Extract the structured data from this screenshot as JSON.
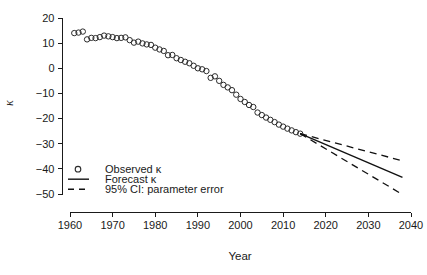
{
  "chart_data": {
    "type": "scatter",
    "title": "",
    "xlabel": "Year",
    "ylabel": "κ",
    "xlim": [
      1956,
      2042
    ],
    "ylim": [
      -54,
      22
    ],
    "xticks": [
      1960,
      1970,
      1980,
      1990,
      2000,
      2010,
      2020,
      2030,
      2040
    ],
    "xtick_labels": [
      "1960",
      "1970",
      "1980",
      "1990",
      "2000",
      "2010",
      "2020",
      "2030",
      "2040"
    ],
    "yticks": [
      20,
      10,
      0,
      -10,
      -20,
      -30,
      -40,
      -50
    ],
    "ytick_labels": [
      "20",
      "10",
      "0",
      "−10",
      "−20",
      "−30",
      "−40",
      "−50"
    ],
    "grid": false,
    "legend_position": "bottom-left",
    "series": [
      {
        "name": "Observed κ",
        "type": "scatter",
        "marker": "open-circle",
        "x": [
          1961,
          1962,
          1963,
          1964,
          1965,
          1966,
          1967,
          1968,
          1969,
          1970,
          1971,
          1972,
          1973,
          1974,
          1975,
          1976,
          1977,
          1978,
          1979,
          1980,
          1981,
          1982,
          1983,
          1984,
          1985,
          1986,
          1987,
          1988,
          1989,
          1990,
          1991,
          1992,
          1993,
          1994,
          1995,
          1996,
          1997,
          1998,
          1999,
          2000,
          2001,
          2002,
          2003,
          2004,
          2005,
          2006,
          2007,
          2008,
          2009,
          2010,
          2011,
          2012,
          2013,
          2014
        ],
        "values": [
          14.0,
          14.2,
          14.6,
          11.5,
          12.1,
          12.0,
          12.4,
          13.0,
          12.7,
          12.4,
          12.0,
          12.1,
          12.3,
          11.2,
          10.2,
          10.6,
          9.9,
          9.5,
          9.3,
          8.2,
          7.5,
          6.9,
          5.2,
          5.3,
          4.0,
          3.3,
          2.6,
          2.0,
          1.0,
          0.0,
          -0.4,
          -1.1,
          -3.8,
          -3.2,
          -5.0,
          -6.6,
          -7.6,
          -8.7,
          -10.5,
          -12.2,
          -13.4,
          -14.6,
          -15.4,
          -17.6,
          -18.6,
          -19.6,
          -20.5,
          -21.4,
          -22.4,
          -23.2,
          -24.0,
          -24.7,
          -25.4,
          -26.0
        ]
      },
      {
        "name": "Forecast κ",
        "type": "line",
        "style": "solid",
        "x": [
          2014,
          2038
        ],
        "values": [
          -26.0,
          -43.4
        ]
      },
      {
        "name": "95% CI: parameter error (upper)",
        "type": "line",
        "style": "dashed",
        "x": [
          2014,
          2038
        ],
        "values": [
          -26.0,
          -36.8
        ]
      },
      {
        "name": "95% CI: parameter error (lower)",
        "type": "line",
        "style": "dashed",
        "x": [
          2014,
          2038
        ],
        "values": [
          -26.0,
          -50.2
        ]
      }
    ],
    "legend": [
      {
        "label": "Observed κ",
        "marker": "open-circle"
      },
      {
        "label": "Forecast κ",
        "marker": "solid-line"
      },
      {
        "label": "95% CI: parameter error",
        "marker": "dashed-line"
      }
    ]
  },
  "colors": {
    "axis": "#1a1a1a",
    "marker": "#2b2b2b",
    "line": "#111111",
    "background": "#ffffff"
  }
}
